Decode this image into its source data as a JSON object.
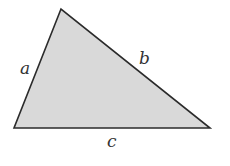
{
  "diagram": {
    "type": "triangle",
    "fill": "#d9d9d9",
    "stroke": "#2b2b2b",
    "vertices": {
      "top": [
        61,
        9
      ],
      "bottom_left": [
        14,
        128
      ],
      "bottom_right": [
        210,
        128
      ]
    },
    "labels": {
      "a": "a",
      "b": "b",
      "c": "c"
    }
  }
}
